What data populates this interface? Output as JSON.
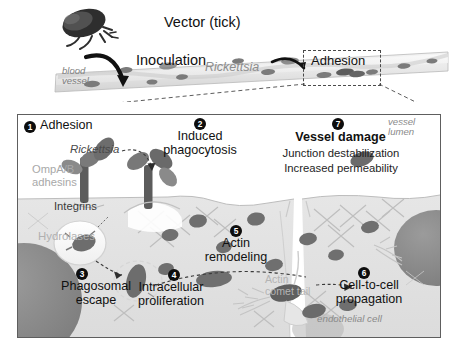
{
  "figure": {
    "title_hidden": "Rickettsia infection of vascular endothelium",
    "colors": {
      "marker_fill": "#0d0d0d",
      "marker_text": "#ffffff",
      "bacteria": "#6f6f6f",
      "bacteria_dark": "#4a4a4a",
      "nucleus": "#8a8a8a",
      "cytoplasm": "#e2e2e2",
      "lumen": "#ffffff",
      "panel_border": "#5e5e5e",
      "dashed_guide": "#4a4a4a",
      "gray_label": "#a8a8a8",
      "text": "#111111"
    }
  },
  "top_scene": {
    "vector_label": "Vector (tick)",
    "inoculation_label": "Inoculation",
    "rickettsia_label": "Rickettsia",
    "blood_vessel_label": "blood\nvessel",
    "adhesion_callout": "Adhesion",
    "tick_icon": "tick-icon",
    "inoculation_arrow_icon": "curved-arrow-icon",
    "spread_arrow_icon": "curved-arrow-icon"
  },
  "panel": {
    "vessel_lumen_label": "vessel\nlumen",
    "endothelial_cell_label": "endothelial cell",
    "steps": [
      {
        "number": "1",
        "marker": "❶",
        "title": "Adhesion",
        "bold": false,
        "sublabels": [
          "Rickettsia",
          "OmpA/B\nadhesins",
          "Integrins"
        ]
      },
      {
        "number": "2",
        "marker": "❷",
        "title": "Induced\nphagocytosis",
        "bold": false,
        "sublabels": []
      },
      {
        "number": "3",
        "marker": "❸",
        "title": "Phagosomal\nescape",
        "bold": false,
        "sublabels": [
          "Hydrolases"
        ]
      },
      {
        "number": "4",
        "marker": "❹",
        "title": "Intracellular\nproliferation",
        "bold": false,
        "sublabels": []
      },
      {
        "number": "5",
        "marker": "❺",
        "title": "Actin\nremodeling",
        "bold": false,
        "sublabels": [
          "Actin\ncomet tail"
        ]
      },
      {
        "number": "6",
        "marker": "❻",
        "title": "Cell-to-cell\npropagation",
        "bold": false,
        "sublabels": []
      },
      {
        "number": "7",
        "marker": "❼",
        "title": "Vessel damage",
        "bold": true,
        "sublabels": [
          "Junction destabilization",
          "Increased permeability"
        ]
      }
    ],
    "labels": {
      "adhesion": "Adhesion",
      "rickettsia": "Rickettsia",
      "ompab_adhesins": "OmpA/B\nadhesins",
      "integrins": "Integrins",
      "hydrolases": "Hydrolases",
      "phagosomal_escape": "Phagosomal\nescape",
      "induced_phagocytosis": "Induced\nphagocytosis",
      "vessel_damage": "Vessel damage",
      "junction_destabilization": "Junction destabilization",
      "increased_permeability": "Increased permeability",
      "actin_remodeling": "Actin\nremodeling",
      "intracellular_proliferation": "Intracellular\nproliferation",
      "actin_comet_tail": "Actin\ncomet tail",
      "cell_to_cell_propagation": "Cell-to-cell\npropagation"
    },
    "markers": {
      "m1": "1",
      "m2": "2",
      "m3": "3",
      "m4": "4",
      "m5": "5",
      "m6": "6",
      "m7": "7"
    }
  }
}
